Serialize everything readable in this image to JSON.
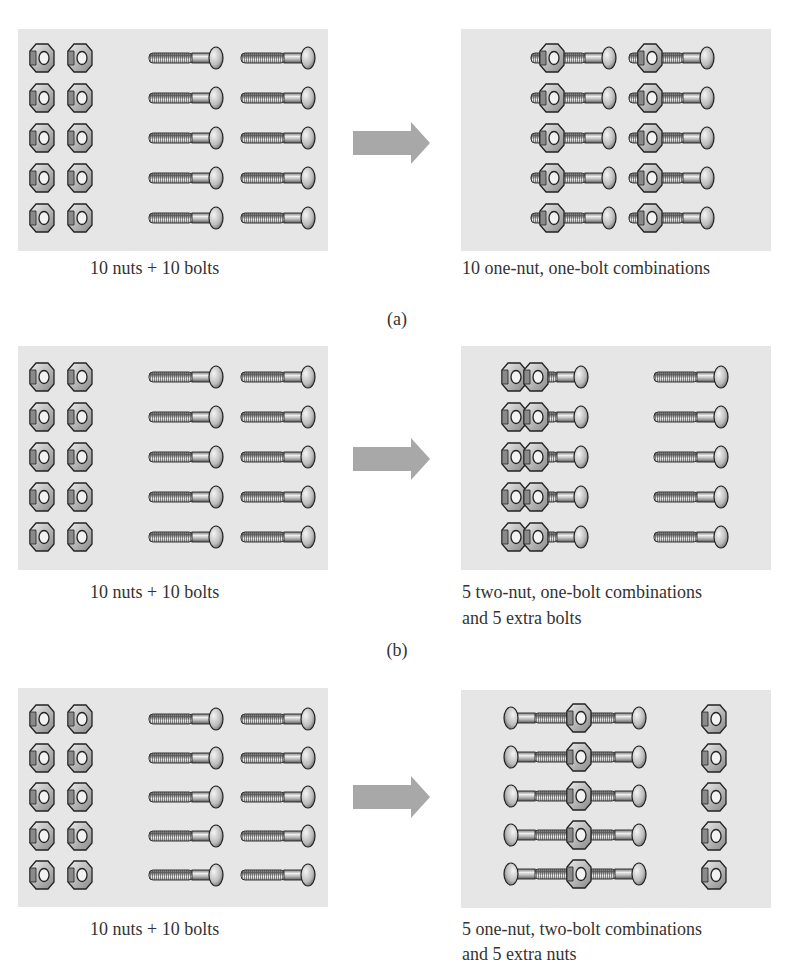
{
  "figure": {
    "rows": [
      {
        "id": "a",
        "label": "(a)",
        "left_caption": "10 nuts + 10 bolts",
        "right_caption_line1": "10 one-nut, one-bolt combinations",
        "right_caption_line2": "",
        "left_contents": {
          "nuts": 10,
          "bolts": 10
        },
        "right_contents": {
          "combination": "one-nut, one-bolt",
          "count": 10,
          "extra": "none"
        }
      },
      {
        "id": "b",
        "label": "(b)",
        "left_caption": "10 nuts + 10 bolts",
        "right_caption_line1": "5 two-nut, one-bolt combinations",
        "right_caption_line2": "and 5 extra bolts",
        "left_contents": {
          "nuts": 10,
          "bolts": 10
        },
        "right_contents": {
          "combination": "two-nut, one-bolt",
          "count": 5,
          "extra": "5 bolts"
        }
      },
      {
        "id": "c",
        "label": "",
        "left_caption": "10 nuts + 10 bolts",
        "right_caption_line1": "5 one-nut, two-bolt combinations",
        "right_caption_line2": "and 5 extra nuts",
        "left_contents": {
          "nuts": 10,
          "bolts": 10
        },
        "right_contents": {
          "combination": "one-nut, two-bolt",
          "count": 5,
          "extra": "5 nuts"
        }
      }
    ],
    "icons": {
      "nut": "hex-nut-icon",
      "bolt": "bolt-icon",
      "arrow": "right-arrow-icon"
    },
    "colors": {
      "panel_bg": "#e6e6e6",
      "arrow": "#a8a8a8",
      "metal_dark": "#3a3a3a",
      "metal_light": "#d8d8d8",
      "text": "#333333"
    }
  }
}
